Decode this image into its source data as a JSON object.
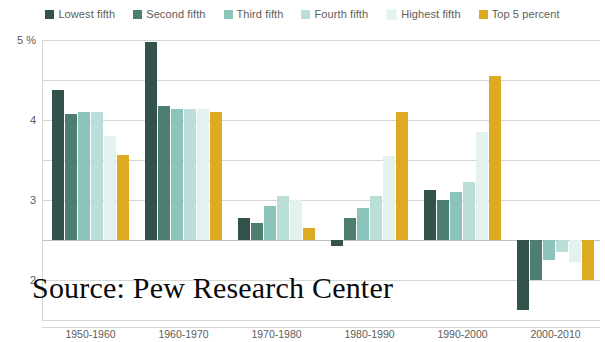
{
  "legend": {
    "items": [
      {
        "label": "Lowest fifth",
        "color": "#33524c"
      },
      {
        "label": "Second fifth",
        "color": "#4e7d72"
      },
      {
        "label": "Third fifth",
        "color": "#8cc3bb"
      },
      {
        "label": "Fourth fifth",
        "color": "#badfd9"
      },
      {
        "label": "Highest fifth",
        "color": "#e3f2ef"
      },
      {
        "label": "Top 5 percent",
        "color": "#ddab21"
      }
    ]
  },
  "yaxis": {
    "unit_label": "5 %",
    "ticks": [
      "5 %",
      "4",
      "3",
      "2",
      "1",
      "0",
      "-1",
      "-2"
    ],
    "tick_values": [
      5,
      4,
      3,
      2,
      1,
      0,
      -1,
      -2
    ],
    "min": -2,
    "max": 5
  },
  "overlay": {
    "source_text": "Source: Pew Research Center"
  },
  "chart_data": {
    "type": "bar",
    "title": "",
    "subtitle": "",
    "xlabel": "",
    "ylabel": "5 %",
    "ylim": [
      -2,
      5
    ],
    "grid": true,
    "legend_position": "top-center",
    "categories": [
      "1950-1960",
      "1960-1970",
      "1970-1980",
      "1980-1990",
      "1990-2000",
      "2000-2010"
    ],
    "series": [
      {
        "name": "Lowest fifth",
        "color": "#33524c",
        "values": [
          3.75,
          4.95,
          0.55,
          -0.15,
          1.25,
          -1.75
        ]
      },
      {
        "name": "Second fifth",
        "color": "#4e7d72",
        "values": [
          3.15,
          3.35,
          0.42,
          0.55,
          1.0,
          -1.0
        ]
      },
      {
        "name": "Third fifth",
        "color": "#8cc3bb",
        "values": [
          3.2,
          3.28,
          0.85,
          0.8,
          1.2,
          -0.5
        ]
      },
      {
        "name": "Fourth fifth",
        "color": "#badfd9",
        "values": [
          3.2,
          3.28,
          1.1,
          1.1,
          1.45,
          -0.3
        ]
      },
      {
        "name": "Highest fifth",
        "color": "#e3f2ef",
        "values": [
          2.6,
          3.28,
          1.0,
          2.1,
          2.7,
          -0.55
        ]
      },
      {
        "name": "Top 5 percent",
        "color": "#ddab21",
        "values": [
          2.12,
          3.2,
          0.3,
          3.2,
          4.1,
          -1.0
        ]
      }
    ]
  }
}
